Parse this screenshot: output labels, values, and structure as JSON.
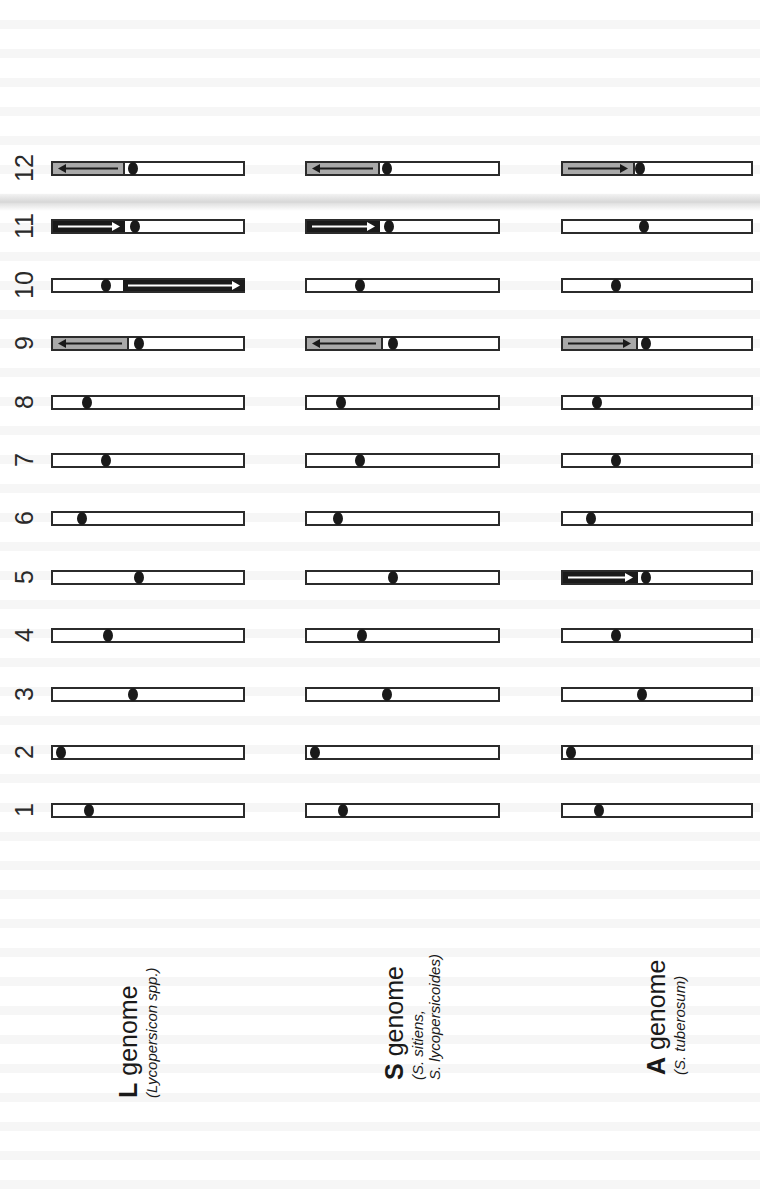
{
  "figure": {
    "colors": {
      "outline": "#2b2b2b",
      "centromere": "#1a1a1a",
      "inversion_gray": "#a9a9a9",
      "inversion_black": "#1a1a1a",
      "arrow_on_black": "#ffffff",
      "arrow_on_gray": "#1a1a1a"
    },
    "chromosome_numbers": [
      "12",
      "11",
      "10",
      "9",
      "8",
      "7",
      "6",
      "5",
      "4",
      "3",
      "2",
      "1"
    ],
    "genomes": [
      {
        "id": "L",
        "letter": "L",
        "word": " genome",
        "subtitle_lines": [
          "(Lycopersicon spp.)"
        ]
      },
      {
        "id": "S",
        "letter": "S",
        "word": " genome",
        "subtitle_lines": [
          "(S. sitiens,",
          "S. lycopersicoides)"
        ]
      },
      {
        "id": "A",
        "letter": "A",
        "word": " genome",
        "subtitle_lines": [
          "(S. tuberosum)"
        ]
      }
    ]
  },
  "chart_data": {
    "type": "diagram",
    "title": "",
    "columns": [
      "L genome (Lycopersicon spp.)",
      "S genome (S. sitiens, S. lycopersicoides)",
      "A genome (S. tuberosum)"
    ],
    "rows": [
      "12",
      "11",
      "10",
      "9",
      "8",
      "7",
      "6",
      "5",
      "4",
      "3",
      "2",
      "1"
    ],
    "centromere_fraction": {
      "L": {
        "12": 0.42,
        "11": 0.43,
        "10": 0.28,
        "9": 0.45,
        "8": 0.18,
        "7": 0.28,
        "6": 0.15,
        "5": 0.45,
        "4": 0.29,
        "3": 0.42,
        "2": 0.04,
        "1": 0.19
      },
      "S": {
        "12": 0.42,
        "11": 0.43,
        "10": 0.28,
        "9": 0.45,
        "8": 0.18,
        "7": 0.28,
        "6": 0.16,
        "5": 0.45,
        "4": 0.29,
        "3": 0.42,
        "2": 0.04,
        "1": 0.19
      },
      "A": {
        "12": 0.41,
        "11": 0.43,
        "10": 0.28,
        "9": 0.44,
        "8": 0.18,
        "7": 0.28,
        "6": 0.15,
        "5": 0.44,
        "4": 0.28,
        "3": 0.42,
        "2": 0.04,
        "1": 0.19
      }
    },
    "inversions": [
      {
        "genome": "L",
        "chromosome": "12",
        "from": 0.0,
        "to": 0.37,
        "fill": "gray",
        "direction": "left"
      },
      {
        "genome": "S",
        "chromosome": "12",
        "from": 0.0,
        "to": 0.37,
        "fill": "gray",
        "direction": "left"
      },
      {
        "genome": "A",
        "chromosome": "12",
        "from": 0.0,
        "to": 0.37,
        "fill": "gray",
        "direction": "right"
      },
      {
        "genome": "L",
        "chromosome": "11",
        "from": 0.0,
        "to": 0.38,
        "fill": "black",
        "direction": "right"
      },
      {
        "genome": "S",
        "chromosome": "11",
        "from": 0.0,
        "to": 0.38,
        "fill": "black",
        "direction": "right"
      },
      {
        "genome": "L",
        "chromosome": "10",
        "from": 0.36,
        "to": 1.0,
        "fill": "black",
        "direction": "right"
      },
      {
        "genome": "L",
        "chromosome": "9",
        "from": 0.0,
        "to": 0.39,
        "fill": "gray",
        "direction": "left"
      },
      {
        "genome": "S",
        "chromosome": "9",
        "from": 0.0,
        "to": 0.39,
        "fill": "gray",
        "direction": "left"
      },
      {
        "genome": "A",
        "chromosome": "9",
        "from": 0.0,
        "to": 0.39,
        "fill": "gray",
        "direction": "right"
      },
      {
        "genome": "A",
        "chromosome": "5",
        "from": 0.0,
        "to": 0.4,
        "fill": "black",
        "direction": "right"
      }
    ]
  }
}
